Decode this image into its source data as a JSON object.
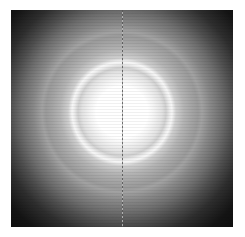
{
  "image": {
    "subject": "diffraction-pattern",
    "description": "Concentric diffraction rings with bright central spot and vertical dashed line",
    "colors": {
      "center": "#ffffff",
      "ring": "#eeeeee",
      "mid_halo": "#a0a0a0",
      "edge": "#0a0a0a",
      "background": "#ffffff"
    }
  }
}
